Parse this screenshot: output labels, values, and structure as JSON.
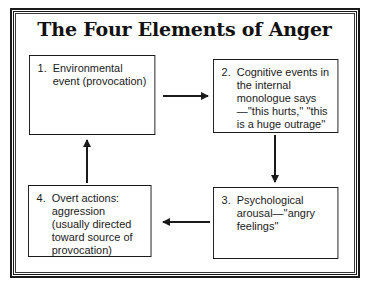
{
  "title": "The Four Elements of Anger",
  "boxes": [
    {
      "number": "1.",
      "text": "Environmental event (provocation)"
    },
    {
      "number": "2.",
      "text": "Cognitive events in the internal monologue says—''this hurts,'' ''this is a huge outrage''"
    },
    {
      "number": "3.",
      "text": "Psychological arousal—''angry feelings''"
    },
    {
      "number": "4.",
      "text": "Overt actions: aggression (usually directed toward source of provocation)"
    }
  ],
  "flow": [
    {
      "from": "1",
      "to": "2",
      "direction": "right"
    },
    {
      "from": "2",
      "to": "3",
      "direction": "down"
    },
    {
      "from": "3",
      "to": "4",
      "direction": "left"
    },
    {
      "from": "4",
      "to": "1",
      "direction": "up"
    }
  ],
  "colors": {
    "line": "#1a1a1a",
    "background": "#ffffff"
  }
}
